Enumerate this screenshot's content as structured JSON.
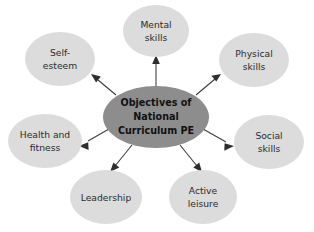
{
  "diagram": {
    "type": "radial-spider-diagram",
    "background_color": "#ffffff",
    "center": {
      "label_lines": [
        "Objectives of",
        "National",
        "Curriculum PE"
      ],
      "line1": "Objectives of",
      "line2": "National",
      "line3": "Curriculum PE",
      "fill_color": "#8d8d8d",
      "text_color": "#111111",
      "cx": 156,
      "cy": 117,
      "rx": 53,
      "ry": 31
    },
    "node_fill_color": "#dcdcdc",
    "node_text_color": "#2b2b2b",
    "connector_color": "#3a3a3a",
    "nodes": [
      {
        "id": "mental-skills",
        "line1": "Mental",
        "line2": "skills",
        "cx": 156,
        "cy": 31,
        "rx": 33,
        "ry": 26
      },
      {
        "id": "physical-skills",
        "line1": "Physical",
        "line2": "skills",
        "cx": 254,
        "cy": 60,
        "rx": 35,
        "ry": 27
      },
      {
        "id": "social-skills",
        "line1": "Social",
        "line2": "skills",
        "cx": 269,
        "cy": 142,
        "rx": 35,
        "ry": 27
      },
      {
        "id": "active-leisure",
        "line1": "Active",
        "line2": "leisure",
        "cx": 203,
        "cy": 197,
        "rx": 34,
        "ry": 27
      },
      {
        "id": "leadership",
        "line1": "Leadership",
        "line2": "",
        "cx": 106,
        "cy": 197,
        "rx": 36,
        "ry": 27
      },
      {
        "id": "health-and-fitness",
        "line1": "Health and",
        "line2": "fitness",
        "cx": 45,
        "cy": 141,
        "rx": 37,
        "ry": 27
      },
      {
        "id": "self-esteem",
        "line1": "Self-",
        "line2": "esteem",
        "cx": 60,
        "cy": 59,
        "rx": 35,
        "ry": 27
      }
    ]
  }
}
